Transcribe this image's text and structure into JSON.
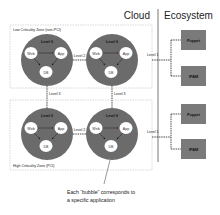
{
  "header": {
    "left_title": "Cloud",
    "right_title": "Ecosystem"
  },
  "zones": [
    {
      "label": "Low Criticality Zone (non-PCI)",
      "bubbles": [
        {
          "level": "Level 0",
          "web": "Web",
          "app": "App",
          "db": "DB"
        },
        {
          "level": "Level 0",
          "web": "Web",
          "app": "App",
          "db": "DB"
        }
      ],
      "link_label": "Level 2",
      "ecosystem_link": "Level 1"
    },
    {
      "label": "High Criticality Zone (PCI)",
      "bubbles": [
        {
          "level": "Level 0",
          "web": "Web",
          "app": "App",
          "db": "DB"
        },
        {
          "level": "Level 0",
          "web": "Web",
          "app": "App",
          "db": "DB"
        }
      ],
      "link_label": "Level 2",
      "ecosystem_link": "Level 1"
    }
  ],
  "inter_zone_links": [
    "Level 3",
    "Level 3"
  ],
  "ecosystem_services": [
    {
      "label": "Puppet"
    },
    {
      "label": "IPAM"
    },
    {
      "label": "Puppet"
    },
    {
      "label": "IPAM"
    }
  ],
  "caption": {
    "line1": "Each “bubble” corresponds to",
    "line2": "a specific application"
  },
  "colors": {
    "bubble": "#6b6b6b",
    "node": "#ffffff",
    "service_box": "#7a7a7a",
    "zone_border": "#cfcfcf",
    "divider": "#555555"
  }
}
